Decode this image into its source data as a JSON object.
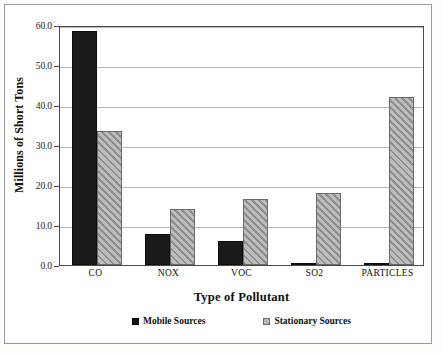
{
  "chart_data": {
    "type": "bar",
    "title": "",
    "xlabel": "Type of Pollutant",
    "ylabel": "Millions of Short Tons",
    "categories": [
      "CO",
      "NOX",
      "VOC",
      "SO2",
      "PARTICLES"
    ],
    "series": [
      {
        "name": "Mobile Sources",
        "values": [
          58.4,
          7.7,
          5.9,
          0.4,
          0.3
        ],
        "color": "#1b1b1b",
        "pattern": "solid"
      },
      {
        "name": "Stationary Sources",
        "values": [
          33.5,
          14.1,
          16.6,
          17.9,
          42.0
        ],
        "color": "#a9a9a9",
        "pattern": "diagonal-hatch"
      }
    ],
    "ylim": [
      0.0,
      60.0
    ],
    "ytick_values": [
      0.0,
      10.0,
      20.0,
      30.0,
      40.0,
      50.0,
      60.0
    ],
    "ytick_labels": [
      "0.0",
      "10.0",
      "20.0",
      "30.0",
      "40.0",
      "50.0",
      "60.0"
    ],
    "grid": true,
    "grid_axis": "y",
    "legend_position": "bottom"
  },
  "legend": {
    "items": [
      {
        "label": "Mobile Sources",
        "swatch": "solid-black-square"
      },
      {
        "label": "Stationary Sources",
        "swatch": "hatched-gray-square"
      }
    ]
  }
}
